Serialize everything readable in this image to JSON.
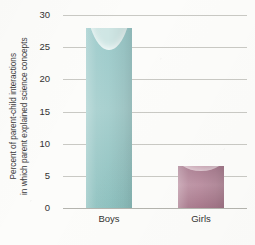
{
  "chart_data": {
    "type": "bar",
    "title": "",
    "xlabel": "",
    "ylabel_lines": [
      "Percent of parent-child interactions",
      "in which parent explained science concepts"
    ],
    "categories": [
      "Boys",
      "Girls"
    ],
    "values": [
      28,
      6.5
    ],
    "series": [
      {
        "name": "Percent of parent-child interactions in which parent explained science concepts",
        "values": [
          28,
          6.5
        ]
      }
    ],
    "ylim": [
      0,
      30
    ],
    "ytick_values": [
      0,
      5,
      10,
      15,
      20,
      25,
      30
    ],
    "ytick_labels": [
      "0",
      "5",
      "10",
      "15",
      "20",
      "25",
      "30"
    ],
    "grid": true,
    "legend": "none",
    "bar_colors": [
      "#a8d0cf",
      "#b58ba0"
    ],
    "background_color": "#fcfcfa",
    "gridline_color": "#c9c9c4",
    "text_color": "#333333"
  }
}
